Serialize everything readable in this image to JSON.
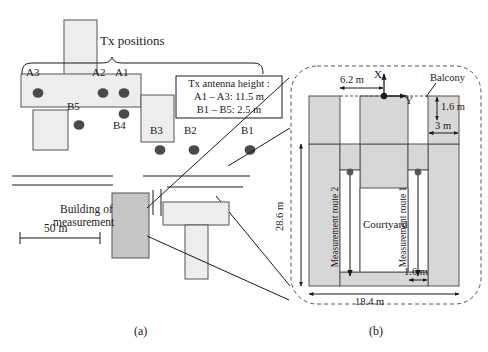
{
  "figure": {
    "panel_a": {
      "caption": "(a)",
      "tx_positions_label": "Tx positions",
      "building_of_measurement_line1": "Building of",
      "building_of_measurement_line2": "measurement",
      "scale_label": "50 m",
      "legend": {
        "line1": "Tx antenna height :",
        "line2": "A1 – A3: 11.5 m",
        "line3": "B1 – B5: 2.5 m"
      },
      "tx_markers": [
        {
          "id": "A3",
          "x": 38,
          "y": 93,
          "label_x": 26,
          "label_y": 72
        },
        {
          "id": "A2",
          "x": 103,
          "y": 93,
          "label_x": 92,
          "label_y": 72
        },
        {
          "id": "A1",
          "x": 124,
          "y": 93,
          "label_x": 115,
          "label_y": 72
        },
        {
          "id": "B5",
          "x": 79,
          "y": 125,
          "label_x": 67,
          "label_y": 104
        },
        {
          "id": "B4",
          "x": 124,
          "y": 114,
          "label_x": 114,
          "label_y": 119
        },
        {
          "id": "B3",
          "x": 160,
          "y": 150,
          "label_x": 150,
          "label_y": 129
        },
        {
          "id": "B2",
          "x": 194,
          "y": 150,
          "label_x": 184,
          "label_y": 129
        },
        {
          "id": "B1",
          "x": 250,
          "y": 150,
          "label_x": 241,
          "label_y": 129
        }
      ]
    },
    "panel_b": {
      "caption": "(b)",
      "balcony_label": "Balcony",
      "courtyard_label": "Courtyard",
      "route1_label": "Measurement route 1",
      "route2_label": "Measurement route 2",
      "axis_x_label": "X",
      "axis_y_label": "Y",
      "dim_top": "6.2 m",
      "dim_balcony_depth": "1.6 m",
      "dim_balcony_width": "3 m",
      "dim_left": "28.6 m",
      "dim_bottom": "18.4 m",
      "dim_corridor": "1.6 m"
    }
  },
  "colors": {
    "building_fill": "#ededed",
    "building_stroke": "#555555",
    "measurement_building_fill": "#c5c5c5",
    "plan_fill": "#d7d7d7",
    "marker_fill": "#4a4a4a",
    "line": "#1a1a1a"
  }
}
